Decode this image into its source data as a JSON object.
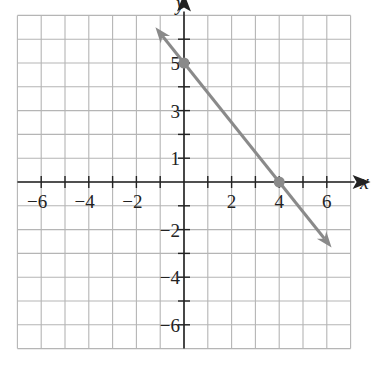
{
  "chart_data": {
    "type": "line",
    "title": "",
    "xlabel": "x",
    "ylabel": "y",
    "xlim": [
      -7,
      7
    ],
    "ylim": [
      -7,
      7
    ],
    "grid": true,
    "x_tick_labels": [
      "−6",
      "−4",
      "−2",
      "2",
      "4",
      "6"
    ],
    "x_tick_values": [
      -6,
      -4,
      -2,
      2,
      4,
      6
    ],
    "y_tick_labels": [
      "5",
      "3",
      "1",
      "−2",
      "−4",
      "−6"
    ],
    "y_tick_values": [
      5,
      3,
      1,
      -2,
      -4,
      -6
    ],
    "series": [
      {
        "name": "line",
        "equation": "y = -5/4 x + 5",
        "x": [
          -1.2,
          6.2
        ],
        "y": [
          6.5,
          -2.75
        ],
        "color": "#8a8a8a"
      }
    ],
    "points": [
      {
        "label": "y-intercept",
        "x": 0,
        "y": 5
      },
      {
        "label": "x-intercept",
        "x": 4,
        "y": 0
      }
    ]
  },
  "colors": {
    "grid": "#b5b5b5",
    "axis": "#222222",
    "line": "#8a8a8a",
    "point": "#8a8a8a"
  }
}
